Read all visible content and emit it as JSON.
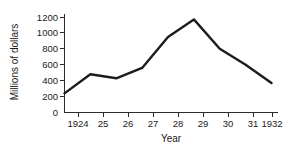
{
  "chart_data": {
    "type": "line",
    "title": "",
    "subtitle": "",
    "xlabel": "Year",
    "ylabel": "Millions of dollars",
    "x": [
      1924,
      1925,
      1926,
      1927,
      1928,
      1929,
      1930,
      1931,
      1932
    ],
    "xticklabels": [
      "1924",
      "25",
      "26",
      "27",
      "28",
      "29",
      "30",
      "31",
      "1932"
    ],
    "values": [
      240,
      480,
      430,
      560,
      950,
      1170,
      800,
      600,
      370
    ],
    "series": [
      {
        "name": "Millions of dollars",
        "values": [
          240,
          480,
          430,
          560,
          950,
          1170,
          800,
          600,
          370
        ]
      }
    ],
    "yticks": [
      0,
      200,
      400,
      600,
      800,
      1000,
      1200
    ],
    "yticklabels": [
      "0",
      "200",
      "400",
      "600",
      "800",
      "1000",
      "1200"
    ],
    "ylim": [
      0,
      1250
    ],
    "xlim": [
      1924,
      1932
    ],
    "grid": false,
    "legend": false,
    "line_color": "#1c1c1c",
    "axis_color": "#2b2b2b"
  }
}
